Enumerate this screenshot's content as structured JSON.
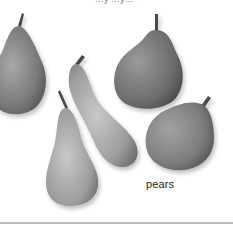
{
  "image": {
    "subject": "pears",
    "count": 5,
    "style": "grayscale photograph"
  },
  "top_text": "…y …y…",
  "caption": "pears",
  "colors": {
    "background": "#ffffff",
    "pear_dark": "#5a5a5a",
    "pear_mid": "#8a8a8a",
    "pear_light": "#bdbdbd",
    "rule": "#bdbdbd",
    "caption_text": "#222222"
  }
}
